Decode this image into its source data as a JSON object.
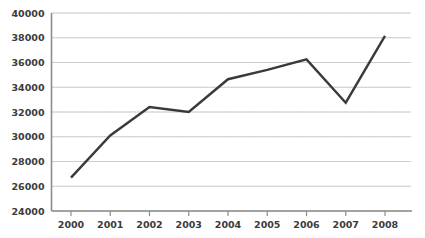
{
  "chart_data": {
    "type": "line",
    "title": "",
    "subtitle": "",
    "xlabel": "",
    "ylabel": "",
    "categories": [
      "2000",
      "2001",
      "2002",
      "2003",
      "2004",
      "2005",
      "2006",
      "2007",
      "2008"
    ],
    "x": [
      2000,
      2001,
      2002,
      2003,
      2004,
      2005,
      2006,
      2007,
      2008
    ],
    "values": [
      26700,
      30100,
      32400,
      32000,
      34650,
      35400,
      36250,
      32750,
      38150
    ],
    "series": [
      {
        "name": "series-1",
        "values": [
          26700,
          30100,
          32400,
          32000,
          34650,
          35400,
          36250,
          32750,
          38150
        ]
      }
    ],
    "ylim": [
      24000,
      40000
    ],
    "ytick_step": 2000,
    "yticks": [
      24000,
      26000,
      28000,
      30000,
      32000,
      34000,
      36000,
      38000,
      40000
    ],
    "ytick_labels": [
      "24000",
      "26000",
      "28000",
      "30000",
      "32000",
      "34000",
      "36000",
      "38000",
      "40000"
    ],
    "xtick_labels": [
      "2000",
      "2001",
      "2002",
      "2003",
      "2004",
      "2005",
      "2006",
      "2007",
      "2008"
    ],
    "grid": true,
    "grid_axis": "y",
    "legend": false,
    "legend_position": "none",
    "annotations": []
  },
  "style": {
    "line_color": "#3a3a3a",
    "grid_color": "#d0d0d0",
    "grid_dot_color": "#c8c8c8",
    "axis_color": "#8c8c8c",
    "label_color": "#3b3b3b",
    "background": "#ffffff",
    "line_width": 2.4
  }
}
